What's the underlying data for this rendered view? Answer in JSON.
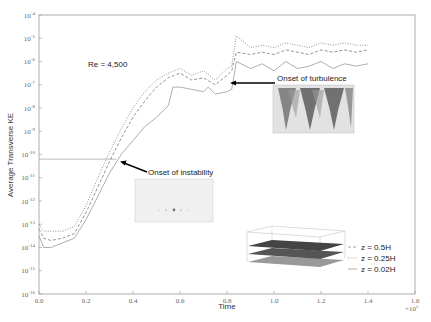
{
  "chart_data": {
    "type": "line",
    "title": "",
    "annotation_main": "Re = 4,500",
    "xlabel": "Time",
    "ylabel": "Average Transverse KE",
    "x_multiplier": "×10^5",
    "xlim": [
      0,
      1.6
    ],
    "ylim_log10": [
      -16,
      -4
    ],
    "yscale": "log",
    "x_ticks": [
      "0.0",
      "0.2",
      "0.4",
      "0.6",
      "0.8",
      "1.0",
      "1.2",
      "1.4",
      "1.6"
    ],
    "y_ticks": [
      "10^-16",
      "10^-15",
      "10^-14",
      "10^-13",
      "10^-12",
      "10^-11",
      "10^-10",
      "10^-9",
      "10^-8",
      "10^-7",
      "10^-6",
      "10^-5",
      "10^-4"
    ],
    "grid": false,
    "legend_position": "lower right",
    "series": [
      {
        "name": "z = 0.5H",
        "style": "dashed",
        "x": [
          0.0,
          0.02,
          0.05,
          0.1,
          0.15,
          0.2,
          0.25,
          0.3,
          0.35,
          0.4,
          0.45,
          0.5,
          0.55,
          0.6,
          0.65,
          0.7,
          0.75,
          0.8,
          0.82,
          0.84,
          0.9,
          0.95,
          1.0,
          1.05,
          1.1,
          1.15,
          1.2,
          1.25,
          1.3,
          1.35,
          1.4
        ],
        "log10_y": [
          -13.2,
          -13.6,
          -13.7,
          -13.6,
          -13.4,
          -12.5,
          -11.4,
          -10.3,
          -9.3,
          -8.4,
          -7.7,
          -7.1,
          -6.7,
          -6.5,
          -6.8,
          -6.7,
          -7.0,
          -6.6,
          -6.4,
          -5.6,
          -5.7,
          -5.6,
          -5.7,
          -5.5,
          -5.6,
          -5.7,
          -5.5,
          -5.6,
          -5.5,
          -5.6,
          -5.5
        ]
      },
      {
        "name": "z = 0.25H",
        "style": "dotted",
        "x": [
          0.0,
          0.02,
          0.05,
          0.1,
          0.15,
          0.2,
          0.25,
          0.3,
          0.35,
          0.4,
          0.45,
          0.5,
          0.55,
          0.6,
          0.65,
          0.7,
          0.75,
          0.8,
          0.82,
          0.84,
          0.9,
          0.95,
          1.0,
          1.05,
          1.1,
          1.15,
          1.2,
          1.25,
          1.3,
          1.35,
          1.4
        ],
        "log10_y": [
          -13.0,
          -13.3,
          -13.3,
          -13.3,
          -13.1,
          -12.2,
          -11.0,
          -9.9,
          -8.9,
          -8.0,
          -7.3,
          -6.8,
          -6.5,
          -6.3,
          -6.6,
          -6.4,
          -6.8,
          -6.3,
          -6.2,
          -4.9,
          -5.4,
          -5.3,
          -5.4,
          -5.2,
          -5.3,
          -5.4,
          -5.2,
          -5.3,
          -5.2,
          -5.3,
          -5.3
        ]
      },
      {
        "name": "z = 0.02H",
        "style": "solid",
        "x": [
          0.0,
          0.02,
          0.05,
          0.1,
          0.15,
          0.2,
          0.25,
          0.3,
          0.35,
          0.4,
          0.45,
          0.5,
          0.55,
          0.57,
          0.6,
          0.65,
          0.7,
          0.72,
          0.75,
          0.8,
          0.82,
          0.84,
          0.9,
          0.95,
          1.0,
          1.05,
          1.1,
          1.15,
          1.2,
          1.25,
          1.3,
          1.35,
          1.4
        ],
        "log10_y": [
          -13.5,
          -14.0,
          -14.0,
          -13.8,
          -13.6,
          -12.8,
          -11.8,
          -10.8,
          -10.0,
          -9.4,
          -8.8,
          -8.4,
          -7.9,
          -7.1,
          -7.1,
          -7.2,
          -7.3,
          -7.1,
          -7.4,
          -7.3,
          -7.2,
          -6.0,
          -6.3,
          -6.1,
          -6.4,
          -6.0,
          -6.3,
          -6.2,
          -6.0,
          -6.3,
          -6.1,
          -6.2,
          -6.1
        ]
      }
    ],
    "annotations": [
      {
        "text": "Onset of instability",
        "x": 0.33,
        "log10_y": -10.2
      },
      {
        "text": "Onset of turbulence",
        "x": 0.82,
        "log10_y": -7.2
      }
    ],
    "reference_line": {
      "log10_y": -10.2,
      "x_end": 0.33
    }
  },
  "labels": {
    "re": "Re = 4,500",
    "xlabel": "Time",
    "ylabel": "Average Transverse KE",
    "xmult": "×10",
    "xmult_exp": "5",
    "onset_instability": "Onset of instability",
    "onset_turbulence": "Onset of turbulence",
    "legend": [
      "z = 0.5H",
      "z = 0.25H",
      "z = 0.02H"
    ]
  }
}
